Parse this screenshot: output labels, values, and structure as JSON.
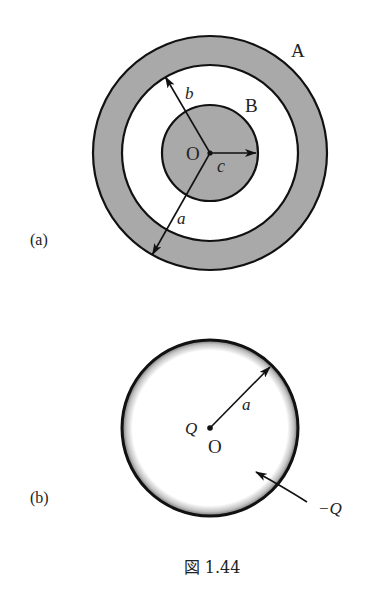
{
  "figure": {
    "caption": "図 1.44",
    "colors": {
      "shade": "#a9a9a9",
      "stroke": "#111111",
      "background": "#ffffff"
    }
  },
  "panel_a": {
    "tag": "(a)",
    "center_label": "O",
    "outer_conductor_label": "A",
    "inner_conductor_label": "B",
    "radius_labels": {
      "outer": "a",
      "inner_shell": "b",
      "core": "c"
    },
    "geometry": {
      "center": [
        210,
        153
      ],
      "outer_radius": 117,
      "shell_inner_radius": 88,
      "core_radius": 48
    }
  },
  "panel_b": {
    "tag": "(b)",
    "center_label": "O",
    "center_charge_label": "Q",
    "radius_label": "a",
    "shell_charge_label": "−Q",
    "geometry": {
      "center": [
        210,
        428
      ],
      "radius": 88
    }
  }
}
